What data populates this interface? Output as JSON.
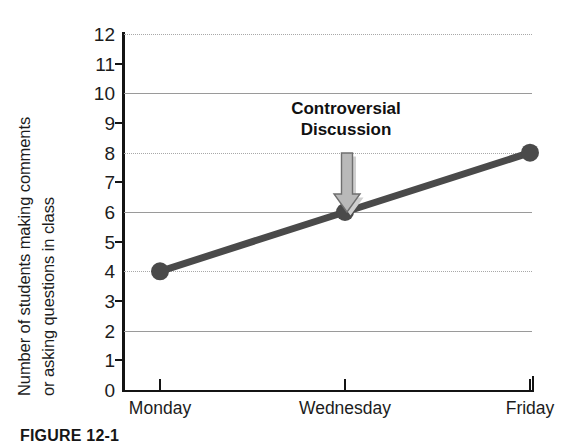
{
  "figure": {
    "caption": "FIGURE 12-1"
  },
  "chart_data": {
    "type": "line",
    "title": "",
    "xlabel": "",
    "ylabel": "Number of students making comments or asking questions in class",
    "ylabel_line1": "Number of students making comments",
    "ylabel_line2": "or asking questions in class",
    "categories": [
      "Monday",
      "Wednesday",
      "Friday"
    ],
    "values": [
      4,
      6,
      8
    ],
    "series": [
      {
        "name": "Students commenting",
        "values": [
          4,
          6,
          8
        ]
      }
    ],
    "ylim": [
      0,
      12
    ],
    "yticks": [
      0,
      1,
      2,
      3,
      4,
      5,
      6,
      7,
      8,
      9,
      10,
      11,
      12
    ],
    "ytick_labels": [
      "0",
      "1",
      "2",
      "3",
      "4",
      "5",
      "6",
      "7",
      "8",
      "9",
      "10",
      "11",
      "12"
    ],
    "gridlines_at": [
      2,
      4,
      6,
      8,
      10,
      12
    ],
    "grid": true,
    "legend": "none",
    "annotations": [
      {
        "text_line1": "Controversial",
        "text_line2": "Discussion",
        "points_to_category": "Wednesday",
        "points_to_value": 6
      }
    ],
    "colors": {
      "line": "#4a4a4a",
      "marker": "#4a4a4a",
      "axis": "#141414",
      "grid_solid": "#9a9a9a",
      "grid_dotted": "#a8a8a8",
      "arrow_fill": "#b5b5b5",
      "arrow_stroke": "#6f6f6f",
      "arrow_shadow": "#cfcfcf",
      "text": "#1c1c1c",
      "background": "#ffffff"
    }
  }
}
